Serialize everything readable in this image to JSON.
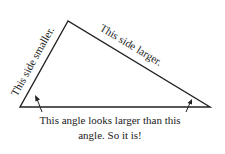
{
  "diagram": {
    "type": "triangle",
    "labels": {
      "short_side": "This side smaller.",
      "long_side": "This side larger.",
      "caption_line1": "This angle looks larger than this",
      "caption_line2": "angle. So it is!"
    },
    "colors": {
      "stroke": "#222222",
      "background": "#ffffff"
    }
  }
}
